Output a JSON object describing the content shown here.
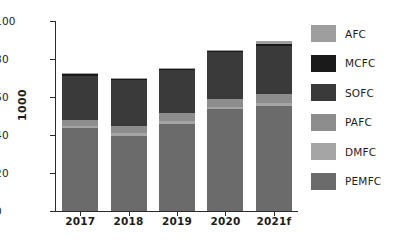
{
  "chart_data": {
    "type": "bar",
    "stacked": true,
    "title": "",
    "subtitle": "",
    "xlabel": "",
    "ylabel": "1000",
    "categories": [
      "2017",
      "2018",
      "2019",
      "2020",
      "2021f"
    ],
    "ylim": [
      0,
      100
    ],
    "yticks": [
      0,
      20,
      40,
      60,
      80,
      100
    ],
    "ytick_labels": [
      "0",
      "20",
      "40",
      "60",
      "80",
      "100"
    ],
    "grid": false,
    "legend_position": "right",
    "series": [
      {
        "name": "PEMFC",
        "color": "#6b6b6b",
        "values": [
          43.5,
          39.5,
          46.0,
          53.5,
          55.5
        ]
      },
      {
        "name": "DMFC",
        "color": "#a5a5a5",
        "values": [
          1.2,
          1.3,
          1.2,
          1.2,
          1.3
        ]
      },
      {
        "name": "PAFC",
        "color": "#8d8d8d",
        "values": [
          3.0,
          4.0,
          4.5,
          4.0,
          5.0
        ]
      },
      {
        "name": "SOFC",
        "color": "#3a3a3a",
        "values": [
          23.5,
          24.2,
          22.3,
          25.0,
          25.0
        ]
      },
      {
        "name": "MCFC",
        "color": "#1a1a1a",
        "values": [
          0.8,
          0.7,
          0.8,
          0.5,
          1.0
        ]
      },
      {
        "name": "AFC",
        "color": "#9e9e9e",
        "values": [
          0.5,
          0.5,
          0.6,
          0.5,
          1.5
        ]
      }
    ],
    "totals": [
      72.5,
      70.2,
      75.4,
      84.7,
      89.3
    ]
  },
  "legend": {
    "items": [
      {
        "label": "AFC",
        "color": "#9e9e9e"
      },
      {
        "label": "MCFC",
        "color": "#1a1a1a"
      },
      {
        "label": "SOFC",
        "color": "#3a3a3a"
      },
      {
        "label": "PAFC",
        "color": "#8d8d8d"
      },
      {
        "label": "DMFC",
        "color": "#a5a5a5"
      },
      {
        "label": "PEMFC",
        "color": "#6b6b6b"
      }
    ]
  },
  "axes": {
    "y_title": "1000",
    "y_tick_labels": [
      "100",
      "80",
      "60",
      "40",
      "20",
      "0"
    ],
    "x_tick_labels": [
      "2017",
      "2018",
      "2019",
      "2020",
      "2021f"
    ]
  }
}
